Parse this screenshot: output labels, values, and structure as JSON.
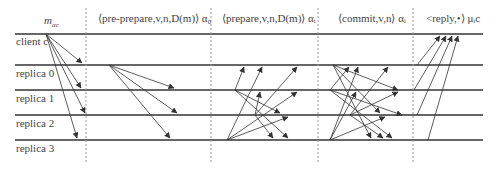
{
  "diagram": {
    "phases": [
      {
        "id": "request",
        "label": "m",
        "sub": "αc",
        "x": 138
      },
      {
        "id": "pre-prepare",
        "label": "⟨pre-prepare,v,n,D(m)⟩ α₀",
        "x": 98
      },
      {
        "id": "prepare",
        "label": "⟨prepare,v,n,D(m)⟩ αᵢ",
        "x": 222
      },
      {
        "id": "commit",
        "label": "⟨commit,v,n⟩ αᵢ",
        "x": 338
      },
      {
        "id": "reply",
        "label": "<reply,•⟩ μᵢc",
        "x": 428
      }
    ],
    "lanes": [
      {
        "label": "client c",
        "y": 34
      },
      {
        "label": "replica 0",
        "y": 65
      },
      {
        "label": "replica 1",
        "y": 90
      },
      {
        "label": "replica 2",
        "y": 115
      },
      {
        "label": "replica 3",
        "y": 140
      }
    ],
    "dividers_x": [
      86,
      211,
      318,
      413
    ],
    "line_color": "#333333",
    "divider_color": "#999999"
  }
}
